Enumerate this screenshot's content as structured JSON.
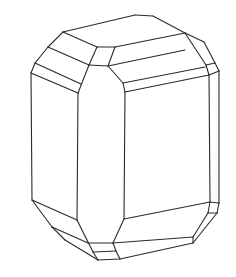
{
  "figure": {
    "description": "Line drawing of a prismatic crystal with beveled terminations",
    "stroke_color": "#2a2a2a",
    "background": "#ffffff",
    "edges": [
      [
        [
          63,
          32
        ],
        [
          135,
          15
        ]
      ],
      [
        [
          135,
          15
        ],
        [
          153,
          16
        ]
      ],
      [
        [
          153,
          16
        ],
        [
          185,
          33
        ]
      ],
      [
        [
          185,
          33
        ],
        [
          204,
          42
        ]
      ],
      [
        [
          204,
          42
        ],
        [
          215,
          63
        ]
      ],
      [
        [
          215,
          63
        ],
        [
          219,
          71
        ]
      ],
      [
        [
          63,
          32
        ],
        [
          48,
          47
        ]
      ],
      [
        [
          48,
          47
        ],
        [
          35,
          63
        ]
      ],
      [
        [
          35,
          63
        ],
        [
          31,
          73
        ]
      ],
      [
        [
          63,
          32
        ],
        [
          97,
          47
        ]
      ],
      [
        [
          97,
          47
        ],
        [
          115,
          47
        ]
      ],
      [
        [
          115,
          47
        ],
        [
          185,
          33
        ]
      ],
      [
        [
          48,
          47
        ],
        [
          89,
          65
        ]
      ],
      [
        [
          35,
          63
        ],
        [
          81,
          84
        ]
      ],
      [
        [
          31,
          73
        ],
        [
          78,
          93
        ]
      ],
      [
        [
          97,
          47
        ],
        [
          89,
          65
        ]
      ],
      [
        [
          89,
          65
        ],
        [
          78,
          93
        ]
      ],
      [
        [
          115,
          47
        ],
        [
          108,
          66
        ]
      ],
      [
        [
          89,
          65
        ],
        [
          108,
          66
        ]
      ],
      [
        [
          108,
          66
        ],
        [
          185,
          50
        ]
      ],
      [
        [
          108,
          66
        ],
        [
          123,
          83
        ]
      ],
      [
        [
          123,
          83
        ],
        [
          125,
          92
        ]
      ],
      [
        [
          123,
          83
        ],
        [
          205,
          67
        ]
      ],
      [
        [
          125,
          92
        ],
        [
          209,
          75
        ]
      ],
      [
        [
          185,
          33
        ],
        [
          206,
          65
        ]
      ],
      [
        [
          206,
          65
        ],
        [
          215,
          63
        ]
      ],
      [
        [
          206,
          65
        ],
        [
          209,
          75
        ]
      ],
      [
        [
          209,
          75
        ],
        [
          219,
          71
        ]
      ],
      [
        [
          31,
          73
        ],
        [
          32,
          200
        ]
      ],
      [
        [
          78,
          93
        ],
        [
          77,
          220
        ]
      ],
      [
        [
          125,
          92
        ],
        [
          124,
          219
        ]
      ],
      [
        [
          209,
          75
        ],
        [
          210,
          202
        ]
      ],
      [
        [
          219,
          71
        ],
        [
          219,
          203
        ]
      ],
      [
        [
          32,
          200
        ],
        [
          77,
          220
        ]
      ],
      [
        [
          32,
          200
        ],
        [
          52,
          227
        ]
      ],
      [
        [
          52,
          227
        ],
        [
          65,
          240
        ]
      ],
      [
        [
          65,
          240
        ],
        [
          98,
          260
        ]
      ],
      [
        [
          52,
          227
        ],
        [
          88,
          243
        ]
      ],
      [
        [
          77,
          220
        ],
        [
          93,
          252
        ]
      ],
      [
        [
          93,
          252
        ],
        [
          98,
          260
        ]
      ],
      [
        [
          88,
          243
        ],
        [
          113,
          243
        ]
      ],
      [
        [
          93,
          252
        ],
        [
          116,
          251
        ]
      ],
      [
        [
          98,
          260
        ],
        [
          120,
          259
        ]
      ],
      [
        [
          113,
          243
        ],
        [
          116,
          251
        ]
      ],
      [
        [
          116,
          251
        ],
        [
          120,
          259
        ]
      ],
      [
        [
          124,
          219
        ],
        [
          113,
          243
        ]
      ],
      [
        [
          124,
          219
        ],
        [
          210,
          202
        ]
      ],
      [
        [
          210,
          202
        ],
        [
          219,
          203
        ]
      ],
      [
        [
          210,
          202
        ],
        [
          208,
          213
        ]
      ],
      [
        [
          219,
          203
        ],
        [
          217,
          213
        ]
      ],
      [
        [
          208,
          213
        ],
        [
          217,
          213
        ]
      ],
      [
        [
          208,
          213
        ],
        [
          193,
          237
        ]
      ],
      [
        [
          217,
          213
        ],
        [
          193,
          243
        ]
      ],
      [
        [
          193,
          237
        ],
        [
          193,
          243
        ]
      ],
      [
        [
          113,
          243
        ],
        [
          193,
          237
        ]
      ],
      [
        [
          120,
          259
        ],
        [
          193,
          243
        ]
      ]
    ]
  }
}
